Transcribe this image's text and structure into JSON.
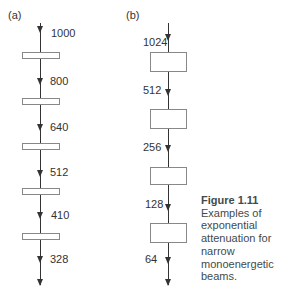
{
  "panels": {
    "a": {
      "label": "(a)",
      "values": [
        "1000",
        "800",
        "640",
        "512",
        "410",
        "328"
      ]
    },
    "b": {
      "label": "(b)",
      "values": [
        "1024",
        "512",
        "256",
        "128",
        "64"
      ]
    }
  },
  "caption": {
    "title": "Figure 1.11",
    "lines": [
      "Examples of",
      "exponential",
      "attenuation for",
      "narrow",
      "monoenergetic",
      "beams."
    ]
  }
}
